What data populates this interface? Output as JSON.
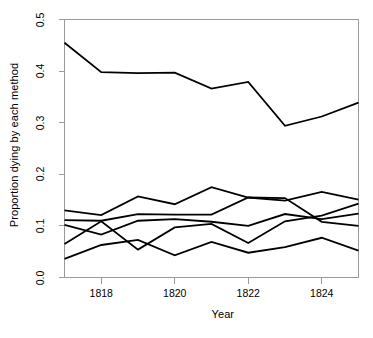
{
  "chart_data": {
    "type": "line",
    "title": "",
    "xlabel": "Year",
    "ylabel": "Proportion dying by each method",
    "x": [
      1817,
      1818,
      1819,
      1820,
      1821,
      1822,
      1823,
      1824,
      1825
    ],
    "xlim": [
      1817,
      1825
    ],
    "ylim": [
      0.0,
      0.5
    ],
    "xticks": [
      1818,
      1820,
      1822,
      1824
    ],
    "xticklabels": [
      "1818",
      "1820",
      "1822",
      "1824"
    ],
    "yticks": [
      0.0,
      0.1,
      0.2,
      0.3,
      0.4,
      0.5
    ],
    "yticklabels": [
      "0.0",
      "0.1",
      "0.2",
      "0.3",
      "0.4",
      "0.5"
    ],
    "grid": false,
    "legend": "none",
    "line_color": "#000000",
    "line_width": 1.8,
    "series": [
      {
        "name": "method-1",
        "values": [
          0.455,
          0.398,
          0.396,
          0.397,
          0.366,
          0.379,
          0.294,
          0.312,
          0.339
        ]
      },
      {
        "name": "method-2",
        "values": [
          0.13,
          0.121,
          0.157,
          0.142,
          0.175,
          0.155,
          0.149,
          0.166,
          0.151
        ]
      },
      {
        "name": "method-3",
        "values": [
          0.111,
          0.11,
          0.123,
          0.122,
          0.122,
          0.155,
          0.154,
          0.108,
          0.1
        ]
      },
      {
        "name": "method-4",
        "values": [
          0.102,
          0.083,
          0.11,
          0.113,
          0.108,
          0.1,
          0.123,
          0.113,
          0.124
        ]
      },
      {
        "name": "method-5",
        "values": [
          0.065,
          0.109,
          0.054,
          0.097,
          0.104,
          0.067,
          0.109,
          0.12,
          0.143
        ]
      },
      {
        "name": "method-6",
        "values": [
          0.036,
          0.063,
          0.073,
          0.043,
          0.069,
          0.048,
          0.059,
          0.077,
          0.052
        ]
      }
    ]
  },
  "axes": {
    "xlabel": "Year",
    "ylabel": "Proportion dying by each method"
  }
}
